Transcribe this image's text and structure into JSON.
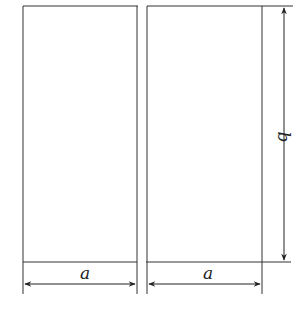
{
  "diagram": {
    "title": "",
    "labels": {
      "width_left": "a",
      "width_right": "a",
      "height": "b"
    },
    "colors": {
      "stroke": "#222222",
      "background": "#ffffff"
    }
  }
}
